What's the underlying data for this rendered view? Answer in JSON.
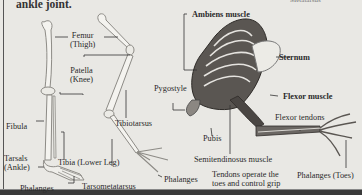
{
  "caption_fragment": "ankle joint.",
  "top_right_fragment": "Metatarsus",
  "human_leg": {
    "labels": {
      "femur": "Femur\n(Thigh)",
      "femur_line1": "Femur",
      "femur_line2": "(Thigh)",
      "patella_line1": "Patella",
      "patella_line2": "(Knee)",
      "fibula": "Fibula",
      "tarsals_line1": "Tarsals",
      "tarsals_line2": "(Ankle)",
      "tibia": "Tibia (Lower Leg)",
      "phalanges": "Phalanges"
    }
  },
  "bird_leg": {
    "labels": {
      "tibiotarsus": "Tibiotarsus",
      "tarsometatarsus": "Tarsometatarsus",
      "phalanges": "Phalanges"
    }
  },
  "bird_muscles": {
    "labels": {
      "ambiens": "Ambiens muscle",
      "sternum": "Sternum",
      "pygostyle": "Pygostyle",
      "flexor_muscle": "Flexor muscle",
      "flexor_tendons": "Flexor tendons",
      "pubis": "Pubis",
      "semitendinosus": "Semitendinosus muscle",
      "tendons_line1": "Tendons operate the",
      "tendons_line2": "toes and control grip",
      "phalanges_toes": "Phalanges (Toes)"
    }
  },
  "colors": {
    "background": "#e9e8e4",
    "bone": "#f4f3ef",
    "bone_shade": "#9a9893",
    "muscle_dark": "#3b3835",
    "text": "#2a2a2a"
  }
}
